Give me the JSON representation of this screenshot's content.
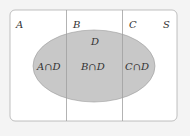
{
  "diagram": {
    "type": "venn",
    "universe_label": "S",
    "partitions": [
      "A",
      "B",
      "C"
    ],
    "event": "D",
    "region_labels": [
      "A∩D",
      "B∩D",
      "C∩D"
    ],
    "colors": {
      "background": "#f4f4f4",
      "universe_fill": "#ffffff",
      "border": "#a8a8a8",
      "ellipse_fill": "#c8c8c8",
      "text": "#333333"
    }
  }
}
